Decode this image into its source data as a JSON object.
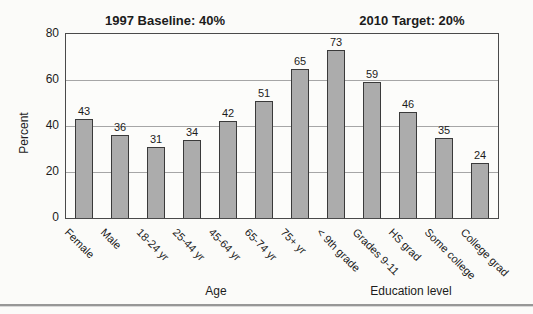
{
  "chart_data": {
    "type": "bar",
    "annotations": [
      "1997 Baseline: 40%",
      "2010 Target: 20%"
    ],
    "ylabel": "Percent",
    "ylim": [
      0,
      80
    ],
    "yticks": [
      0,
      20,
      40,
      60,
      80
    ],
    "gridlines": [
      20,
      40,
      60
    ],
    "grid": "horizontal",
    "legend": "none",
    "categories": [
      "Female",
      "Male",
      "18-24 yr",
      "25-44 yr",
      "45-64 yr",
      "65-74 yr",
      "75+ yr",
      "< 9th grade",
      "Grades 9-11",
      "HS grad",
      "Some college",
      "College grad"
    ],
    "values": [
      43,
      36,
      31,
      34,
      42,
      51,
      65,
      73,
      59,
      46,
      35,
      24
    ],
    "group_labels": [
      {
        "text": "Age",
        "categories": [
          "18-24 yr",
          "25-44 yr",
          "45-64 yr",
          "65-74 yr",
          "75+ yr"
        ]
      },
      {
        "text": "Education level",
        "categories": [
          "< 9th grade",
          "Grades 9-11",
          "HS grad",
          "Some college",
          "College grad"
        ]
      }
    ],
    "colors": {
      "bar_fill": "#acacac",
      "bar_border": "#3a3a3a",
      "plot_border": "#4a4a4a",
      "gridline": "#a6a6a6",
      "text": "#1c1c1c",
      "background": "#fbfbf9",
      "bottom_rule": "#979797"
    }
  }
}
